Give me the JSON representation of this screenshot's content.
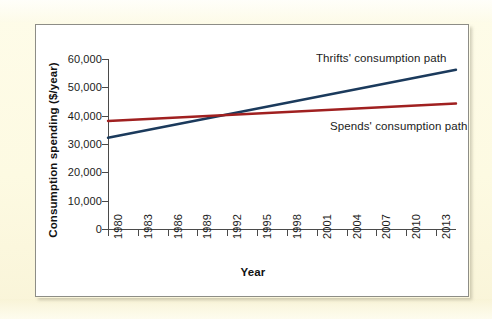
{
  "figure": {
    "background_color": "#fdfbe8",
    "panel_color": "#ffffff",
    "panel_border_color": "#8d8d86"
  },
  "chart_data": {
    "type": "line",
    "title": "",
    "xlabel": "Year",
    "ylabel": "Consumption spending ($/year)",
    "xlim": [
      1980,
      2015
    ],
    "ylim": [
      0,
      60000
    ],
    "grid": false,
    "legend_position": "inline-annotation",
    "x_tick_labels": [
      "1980",
      "1983",
      "1986",
      "1989",
      "1992",
      "1995",
      "1998",
      "2001",
      "2004",
      "2007",
      "2010",
      "2013"
    ],
    "x_ticks": [
      1980,
      1983,
      1986,
      1989,
      1992,
      1995,
      1998,
      2001,
      2004,
      2007,
      2010,
      2013
    ],
    "y_tick_labels": [
      "0",
      "10,000",
      "20,000",
      "30,000",
      "40,000",
      "50,000",
      "60,000"
    ],
    "y_ticks": [
      0,
      10000,
      20000,
      30000,
      40000,
      50000,
      60000
    ],
    "series": [
      {
        "name": "Thrifts' consumption path",
        "color": "#1b3a5c",
        "x": [
          1980,
          2015
        ],
        "values": [
          32200,
          56200
        ],
        "annotation": "Thrifts' consumption path"
      },
      {
        "name": "Spends' consumption path",
        "color": "#a02020",
        "x": [
          1980,
          2015
        ],
        "values": [
          38100,
          44300
        ],
        "annotation": "Spends' consumption path"
      }
    ],
    "crossover": {
      "year": 1994.5,
      "value": 41100
    }
  },
  "annotations": {
    "thrifts_label": "Thrifts' consumption path",
    "spends_label": "Spends' consumption path"
  },
  "axes": {
    "y_title": "Consumption spending ($/year)",
    "x_title": "Year"
  }
}
